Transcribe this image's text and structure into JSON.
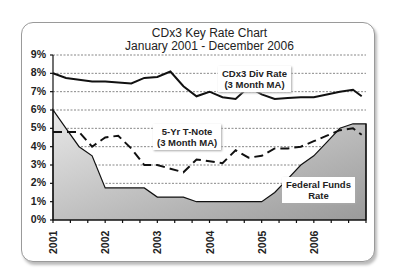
{
  "title_line1": "CDx3 Key Rate Chart",
  "title_line2": "January 2001 - December 2006",
  "y_ticks": [
    "9%",
    "8%",
    "7%",
    "6%",
    "5%",
    "4%",
    "3%",
    "2%",
    "1%",
    "0%"
  ],
  "x_ticks": [
    "2001",
    "2002",
    "2003",
    "2004",
    "2005",
    "2006"
  ],
  "labels": {
    "cdx3_line1": "CDx3 Div Rate",
    "cdx3_line2": "(3 Month MA)",
    "tnote_line1": "5-Yr T-Note",
    "tnote_line2": "(3 Month MA)",
    "fed_line1": "Federal Funds",
    "fed_line2": "Rate"
  },
  "chart_data": {
    "type": "line",
    "xlabel": "",
    "ylabel": "",
    "ylim": [
      0,
      9
    ],
    "y_unit": "%",
    "grid": "horizontal dotted",
    "x_months_from_jan_2001": [
      0,
      3,
      6,
      9,
      12,
      15,
      18,
      21,
      24,
      27,
      30,
      33,
      36,
      39,
      42,
      45,
      48,
      51,
      54,
      57,
      60,
      63,
      66,
      69,
      71
    ],
    "series": [
      {
        "name": "CDx3 Div Rate (3 Month MA)",
        "style": "solid",
        "values": [
          8.0,
          7.75,
          7.65,
          7.55,
          7.55,
          7.5,
          7.45,
          7.75,
          7.8,
          8.1,
          7.3,
          6.75,
          7.0,
          6.7,
          6.6,
          7.25,
          6.85,
          6.6,
          6.65,
          6.7,
          6.7,
          6.85,
          7.0,
          7.1,
          6.75
        ]
      },
      {
        "name": "5-Yr T-Note (3 Month MA)",
        "style": "dashed",
        "values": [
          4.8,
          4.8,
          4.8,
          4.0,
          4.5,
          4.6,
          3.9,
          3.0,
          3.0,
          2.8,
          2.6,
          3.3,
          3.2,
          3.1,
          3.8,
          3.4,
          3.5,
          3.9,
          3.9,
          4.0,
          4.3,
          4.6,
          4.9,
          5.0,
          4.65
        ]
      },
      {
        "name": "Federal Funds Rate",
        "style": "filled-area",
        "values": [
          6.0,
          5.0,
          4.0,
          3.5,
          1.75,
          1.75,
          1.75,
          1.75,
          1.25,
          1.25,
          1.25,
          1.0,
          1.0,
          1.0,
          1.0,
          1.0,
          1.0,
          1.5,
          2.25,
          3.0,
          3.5,
          4.25,
          5.0,
          5.25,
          5.25
        ]
      }
    ]
  }
}
